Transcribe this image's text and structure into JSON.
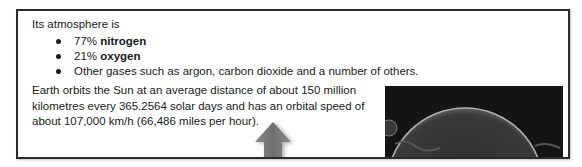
{
  "document": {
    "intro": "Its atmosphere is",
    "bullets": [
      {
        "prefix": "77% ",
        "bold": "nitrogen",
        "suffix": ""
      },
      {
        "prefix": "21% ",
        "bold": "oxygen",
        "suffix": ""
      },
      {
        "prefix": "Other gases such as argon, carbon dioxide and a number of others.",
        "bold": "",
        "suffix": ""
      }
    ],
    "paragraph_lines": [
      "Earth orbits the Sun at an average distance of about 150 million",
      "kilometres every 365.2564 solar days and has an orbital speed of",
      "about 107,000 km/h (66,486 miles per hour)."
    ],
    "image": {
      "description": "dark photo of a planet limb (Earth from space)",
      "background": "#141414"
    },
    "arrow": {
      "direction": "up",
      "color": "#7a7a7a"
    },
    "colors": {
      "border": "#2b2b2b",
      "text": "#1a1a1a"
    }
  }
}
